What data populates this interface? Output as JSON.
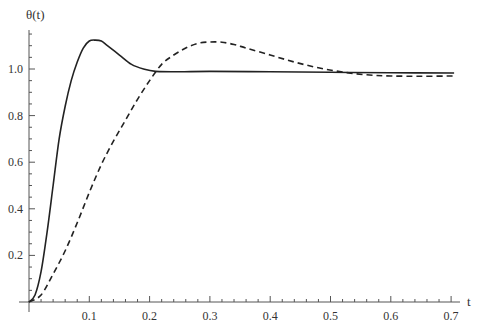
{
  "chart_data": {
    "type": "line",
    "title": "",
    "xlabel": "t",
    "ylabel": "θ(t)",
    "xlim": [
      0,
      0.71
    ],
    "ylim": [
      0,
      1.16
    ],
    "grid": false,
    "legend": "none",
    "x_ticks": [
      {
        "value": 0.1,
        "label": "0.1"
      },
      {
        "value": 0.2,
        "label": "0.2"
      },
      {
        "value": 0.3,
        "label": "0.3"
      },
      {
        "value": 0.4,
        "label": "0.4"
      },
      {
        "value": 0.5,
        "label": "0.5"
      },
      {
        "value": 0.6,
        "label": "0.6"
      },
      {
        "value": 0.7,
        "label": "0.7"
      }
    ],
    "y_ticks": [
      {
        "value": 0.2,
        "label": "0.2"
      },
      {
        "value": 0.4,
        "label": "0.4"
      },
      {
        "value": 0.6,
        "label": "0.6"
      },
      {
        "value": 0.8,
        "label": "0.8"
      },
      {
        "value": 1.0,
        "label": "1.0"
      }
    ],
    "series": [
      {
        "name": "solid",
        "style": "solid",
        "color": "#222222",
        "points": [
          [
            0,
            0
          ],
          [
            0.01,
            0.03
          ],
          [
            0.02,
            0.13
          ],
          [
            0.03,
            0.3
          ],
          [
            0.04,
            0.5
          ],
          [
            0.05,
            0.7
          ],
          [
            0.06,
            0.84
          ],
          [
            0.07,
            0.95
          ],
          [
            0.08,
            1.03
          ],
          [
            0.09,
            1.09
          ],
          [
            0.1,
            1.12
          ],
          [
            0.11,
            1.124
          ],
          [
            0.12,
            1.12
          ],
          [
            0.13,
            1.1
          ],
          [
            0.15,
            1.06
          ],
          [
            0.17,
            1.02
          ],
          [
            0.19,
            1.0
          ],
          [
            0.21,
            0.99
          ],
          [
            0.25,
            0.988
          ],
          [
            0.3,
            0.99
          ],
          [
            0.4,
            0.988
          ],
          [
            0.5,
            0.986
          ],
          [
            0.6,
            0.984
          ],
          [
            0.705,
            0.983
          ]
        ]
      },
      {
        "name": "dashed",
        "style": "dashed",
        "color": "#222222",
        "points": [
          [
            0,
            0
          ],
          [
            0.02,
            0.03
          ],
          [
            0.04,
            0.12
          ],
          [
            0.06,
            0.22
          ],
          [
            0.08,
            0.34
          ],
          [
            0.1,
            0.47
          ],
          [
            0.12,
            0.59
          ],
          [
            0.14,
            0.69
          ],
          [
            0.16,
            0.78
          ],
          [
            0.18,
            0.87
          ],
          [
            0.2,
            0.95
          ],
          [
            0.22,
            1.02
          ],
          [
            0.24,
            1.06
          ],
          [
            0.26,
            1.09
          ],
          [
            0.28,
            1.11
          ],
          [
            0.3,
            1.116
          ],
          [
            0.32,
            1.115
          ],
          [
            0.34,
            1.105
          ],
          [
            0.36,
            1.09
          ],
          [
            0.4,
            1.06
          ],
          [
            0.44,
            1.03
          ],
          [
            0.48,
            1.005
          ],
          [
            0.52,
            0.987
          ],
          [
            0.56,
            0.975
          ],
          [
            0.6,
            0.97
          ],
          [
            0.65,
            0.969
          ],
          [
            0.705,
            0.97
          ]
        ]
      }
    ]
  }
}
